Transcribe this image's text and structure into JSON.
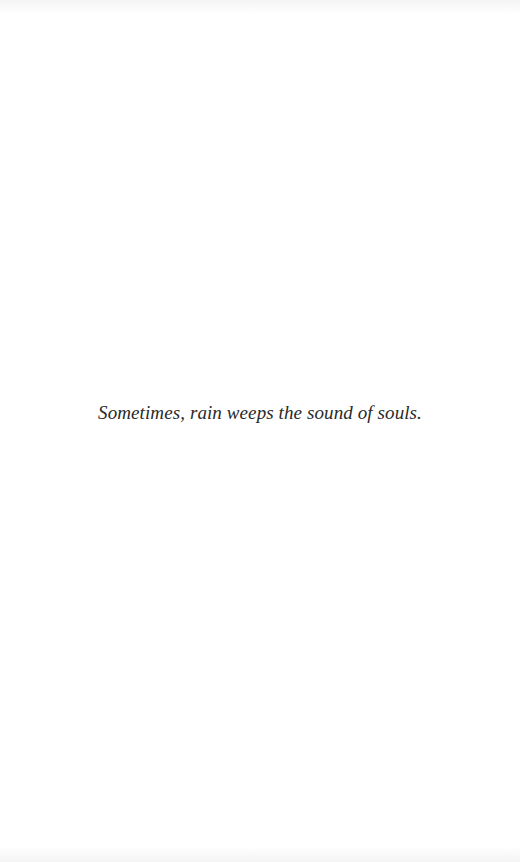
{
  "page": {
    "background_color": "#ffffff",
    "text_color": "#2a2a2a"
  },
  "epigraph": {
    "text": "Sometimes, rain weeps the sound of souls."
  }
}
